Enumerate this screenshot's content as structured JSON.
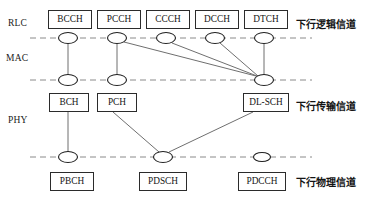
{
  "diagram": {
    "canvas": {
      "width": 366,
      "height": 203
    },
    "colors": {
      "box_border": "#2b2b2b",
      "dashed_line": "#8a8a8a",
      "connector": "#6f6f6f",
      "node_stroke": "#1f1f1f",
      "text": "#141414",
      "background": "#ffffff"
    },
    "layer_labels": [
      {
        "id": "rlc",
        "text": "RLC",
        "x": 8,
        "y": 18
      },
      {
        "id": "mac",
        "text": "MAC",
        "x": 6,
        "y": 53
      },
      {
        "id": "phy",
        "text": "PHY",
        "x": 8,
        "y": 115
      }
    ],
    "group_labels": [
      {
        "id": "logical",
        "text": "下行逻辑信道",
        "x": 296,
        "y": 16
      },
      {
        "id": "transport",
        "text": "下行传输信道",
        "x": 296,
        "y": 98
      },
      {
        "id": "physical",
        "text": "下行物理信道",
        "x": 296,
        "y": 174
      }
    ],
    "dashed_lines": [
      {
        "id": "rlc-mac-boundary",
        "x1": 30,
        "x2": 312,
        "y": 38
      },
      {
        "id": "mac-phy-boundary",
        "x1": 30,
        "x2": 312,
        "y": 80
      },
      {
        "id": "phy-physical-boundary",
        "x1": 30,
        "x2": 312,
        "y": 157
      }
    ],
    "boxes": [
      {
        "id": "bcch",
        "label": "BCCH",
        "x": 48,
        "y": 10,
        "w": 44,
        "h": 19
      },
      {
        "id": "pcch",
        "label": "PCCH",
        "x": 97,
        "y": 10,
        "w": 44,
        "h": 19
      },
      {
        "id": "ccch",
        "label": "CCCH",
        "x": 146,
        "y": 10,
        "w": 44,
        "h": 19
      },
      {
        "id": "dcch",
        "label": "DCCH",
        "x": 195,
        "y": 10,
        "w": 44,
        "h": 19
      },
      {
        "id": "dtch",
        "label": "DTCH",
        "x": 244,
        "y": 10,
        "w": 44,
        "h": 19
      },
      {
        "id": "bch",
        "label": "BCH",
        "x": 49,
        "y": 93,
        "w": 40,
        "h": 19
      },
      {
        "id": "pch",
        "label": "PCH",
        "x": 97,
        "y": 93,
        "w": 40,
        "h": 19
      },
      {
        "id": "dlsch",
        "label": "DL-SCH",
        "x": 243,
        "y": 93,
        "w": 46,
        "h": 19
      },
      {
        "id": "pbch",
        "label": "PBCH",
        "x": 50,
        "y": 172,
        "w": 44,
        "h": 19
      },
      {
        "id": "pdsch",
        "label": "PDSCH",
        "x": 139,
        "y": 172,
        "w": 48,
        "h": 19
      },
      {
        "id": "pdcch",
        "label": "PDCCH",
        "x": 238,
        "y": 172,
        "w": 48,
        "h": 19
      }
    ],
    "nodes": [
      {
        "id": "n-bcch",
        "cx": 68,
        "cy": 38,
        "rx": 9.5,
        "ry": 5.5
      },
      {
        "id": "n-pcch",
        "cx": 117,
        "cy": 38,
        "rx": 9.5,
        "ry": 5.5
      },
      {
        "id": "n-ccch",
        "cx": 166,
        "cy": 38,
        "rx": 9.5,
        "ry": 5.5
      },
      {
        "id": "n-dcch",
        "cx": 215,
        "cy": 38,
        "rx": 9.5,
        "ry": 5.5
      },
      {
        "id": "n-dtch",
        "cx": 264,
        "cy": 38,
        "rx": 9.5,
        "ry": 5.5
      },
      {
        "id": "n-bch",
        "cx": 68,
        "cy": 80,
        "rx": 9.5,
        "ry": 5.5
      },
      {
        "id": "n-pch",
        "cx": 117,
        "cy": 80,
        "rx": 9.5,
        "ry": 5.5
      },
      {
        "id": "n-dlsch",
        "cx": 264,
        "cy": 80,
        "rx": 9.5,
        "ry": 5.5
      },
      {
        "id": "n-pbch",
        "cx": 68,
        "cy": 157,
        "rx": 9.5,
        "ry": 5.5
      },
      {
        "id": "n-pdsch",
        "cx": 163,
        "cy": 157,
        "rx": 9.5,
        "ry": 5.5
      },
      {
        "id": "n-pdcch",
        "cx": 262,
        "cy": 157,
        "rx": 8.5,
        "ry": 4.5
      }
    ],
    "connections": [
      {
        "id": "bcch-bch",
        "from": "BCCH",
        "to": "BCH",
        "x1": 68,
        "y1": 43.5,
        "x2": 68,
        "y2": 74.5
      },
      {
        "id": "pcch-pch",
        "from": "PCCH",
        "to": "PCH",
        "x1": 117,
        "y1": 43.5,
        "x2": 117,
        "y2": 74.5
      },
      {
        "id": "pcch-dlsch",
        "from": "PCCH",
        "to": "DL-SCH",
        "x1": 124,
        "y1": 42,
        "x2": 256,
        "y2": 76
      },
      {
        "id": "ccch-dlsch",
        "from": "CCCH",
        "to": "DL-SCH",
        "x1": 172,
        "y1": 43,
        "x2": 257,
        "y2": 76
      },
      {
        "id": "dcch-dlsch",
        "from": "DCCH",
        "to": "DL-SCH",
        "x1": 220,
        "y1": 43,
        "x2": 258,
        "y2": 76
      },
      {
        "id": "dtch-dlsch",
        "from": "DTCH",
        "to": "DL-SCH",
        "x1": 264,
        "y1": 43.5,
        "x2": 264,
        "y2": 74.5
      },
      {
        "id": "bch-pbch",
        "from": "BCH",
        "to": "PBCH",
        "x1": 68,
        "y1": 112,
        "x2": 68,
        "y2": 151.5
      },
      {
        "id": "pch-pdsch",
        "from": "PCH",
        "to": "PDSCH",
        "x1": 113,
        "y1": 112,
        "x2": 159,
        "y2": 152
      },
      {
        "id": "dlsch-pdsch",
        "from": "DL-SCH",
        "to": "PDSCH",
        "x1": 253,
        "y1": 112,
        "x2": 169,
        "y2": 152
      }
    ]
  }
}
